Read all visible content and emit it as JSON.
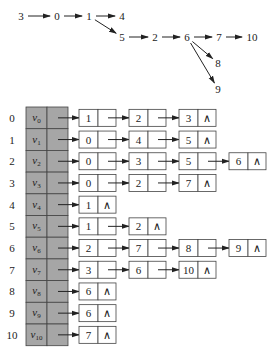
{
  "graph": {
    "nodes": [
      {
        "id": "3",
        "label": "3"
      },
      {
        "id": "0",
        "label": "0"
      },
      {
        "id": "1",
        "label": "1"
      },
      {
        "id": "4",
        "label": "4"
      },
      {
        "id": "5",
        "label": "5"
      },
      {
        "id": "2",
        "label": "2"
      },
      {
        "id": "6",
        "label": "6"
      },
      {
        "id": "7",
        "label": "7"
      },
      {
        "id": "10",
        "label": "10"
      },
      {
        "id": "8",
        "label": "8"
      },
      {
        "id": "9",
        "label": "9"
      }
    ],
    "edges": [
      [
        "3",
        "0"
      ],
      [
        "0",
        "1"
      ],
      [
        "1",
        "4"
      ],
      [
        "1",
        "5"
      ],
      [
        "5",
        "2"
      ],
      [
        "2",
        "6"
      ],
      [
        "6",
        "7"
      ],
      [
        "7",
        "10"
      ],
      [
        "6",
        "8"
      ],
      [
        "6",
        "9"
      ]
    ]
  },
  "adjacency": {
    "null_symbol": "∧",
    "rows": [
      {
        "index": "0",
        "vertex": "v",
        "sub": "0",
        "list": [
          "1",
          "2",
          "3"
        ]
      },
      {
        "index": "1",
        "vertex": "v",
        "sub": "1",
        "list": [
          "0",
          "4",
          "5"
        ]
      },
      {
        "index": "2",
        "vertex": "v",
        "sub": "2",
        "list": [
          "0",
          "3",
          "5",
          "6"
        ]
      },
      {
        "index": "3",
        "vertex": "v",
        "sub": "3",
        "list": [
          "0",
          "2",
          "7"
        ]
      },
      {
        "index": "4",
        "vertex": "v",
        "sub": "4",
        "list": [
          "1"
        ]
      },
      {
        "index": "5",
        "vertex": "v",
        "sub": "5",
        "list": [
          "1",
          "2"
        ]
      },
      {
        "index": "6",
        "vertex": "v",
        "sub": "6",
        "list": [
          "2",
          "7",
          "8",
          "9"
        ]
      },
      {
        "index": "7",
        "vertex": "v",
        "sub": "7",
        "list": [
          "3",
          "6",
          "10"
        ]
      },
      {
        "index": "8",
        "vertex": "v",
        "sub": "8",
        "list": [
          "6"
        ]
      },
      {
        "index": "9",
        "vertex": "v",
        "sub": "9",
        "list": [
          "6"
        ]
      },
      {
        "index": "10",
        "vertex": "v",
        "sub": "10",
        "list": [
          "7"
        ]
      }
    ]
  },
  "colors": {
    "head_fill": "#a6a6a6",
    "line": "#444444",
    "node_fill": "#ffffff"
  }
}
